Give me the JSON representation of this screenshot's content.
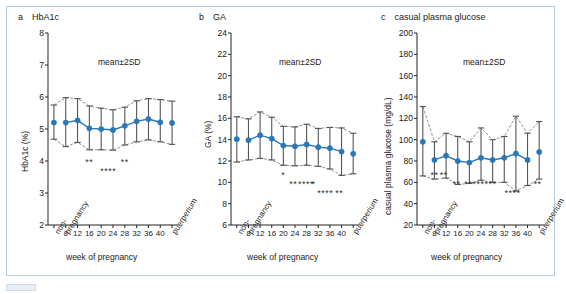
{
  "figure": {
    "background": "#ffffff",
    "frame_color": "#b9cfe0",
    "marker_color": "#2a77b8",
    "line_color": "#2a77b8",
    "errorbar_color": "#555555",
    "envelope_color": "#777777"
  },
  "common": {
    "xlabel": "week of pregnancy",
    "meansd": "mean±2SD",
    "x_categories": [
      "non-\npregnancy",
      "8",
      "12",
      "16",
      "20",
      "24",
      "28",
      "32",
      "36",
      "40",
      "puerperium"
    ],
    "x_left_label": "non-\npregnancy",
    "x_right_label": "puerperium",
    "x_numeric_ticks": [
      "8",
      "12",
      "16",
      "20",
      "24",
      "28",
      "32",
      "36",
      "40"
    ]
  },
  "chart_data": [
    {
      "panel": "a",
      "type": "line",
      "title": "a  HbA1c",
      "panel_letter": "a",
      "panel_name": "HbA1c",
      "ylabel": "HbA1c (%)",
      "xlabel": "week of pregnancy",
      "annotation": "mean±2SD",
      "ylim": [
        2,
        8
      ],
      "yticks": [
        2,
        3,
        4,
        5,
        6,
        7,
        8
      ],
      "grid": false,
      "legend": "none",
      "categories": [
        "non-pregnancy",
        "8",
        "12",
        "16",
        "20",
        "24",
        "28",
        "32",
        "36",
        "40",
        "puerperium"
      ],
      "values": [
        5.2,
        5.2,
        5.27,
        5.02,
        5.0,
        4.97,
        5.1,
        5.24,
        5.31,
        5.21,
        5.19
      ],
      "upper_2sd": [
        5.75,
        5.98,
        5.95,
        5.72,
        5.65,
        5.6,
        5.68,
        5.88,
        5.95,
        5.92,
        5.87
      ],
      "lower_2sd": [
        4.68,
        4.45,
        4.58,
        4.35,
        4.35,
        4.34,
        4.5,
        4.6,
        4.66,
        4.6,
        4.52
      ],
      "significance_rows": [
        {
          "marks": "**",
          "x_index": 3,
          "row": 0
        },
        {
          "marks": "**",
          "x_index": 6,
          "row": 0
        },
        {
          "marks": "****",
          "x_index": 4.6,
          "row": 1
        }
      ]
    },
    {
      "panel": "b",
      "type": "line",
      "title": "b  GA",
      "panel_letter": "b",
      "panel_name": "GA",
      "ylabel": "GA (%)",
      "xlabel": "week of pregnancy",
      "annotation": "mean±2SD",
      "ylim": [
        6,
        24
      ],
      "yticks": [
        6,
        8,
        10,
        12,
        14,
        16,
        18,
        20,
        22,
        24
      ],
      "grid": false,
      "legend": "none",
      "categories": [
        "non-pregnancy",
        "8",
        "12",
        "16",
        "20",
        "24",
        "28",
        "32",
        "36",
        "40",
        "puerperium"
      ],
      "values": [
        14.05,
        13.95,
        14.42,
        14.1,
        13.45,
        13.38,
        13.55,
        13.3,
        13.2,
        12.88,
        12.68
      ],
      "upper_2sd": [
        16.15,
        15.95,
        16.6,
        16.1,
        15.25,
        15.2,
        15.45,
        15.05,
        15.15,
        15.1,
        14.6
      ],
      "lower_2sd": [
        11.9,
        12.1,
        12.25,
        12.1,
        11.6,
        11.55,
        11.6,
        11.5,
        11.25,
        10.65,
        10.8
      ],
      "significance_rows": [
        {
          "marks": "*",
          "x_index": 4,
          "row": 0
        },
        {
          "marks": "**",
          "x_index": 4.85,
          "row": 1
        },
        {
          "marks": "****",
          "x_index": 5.95,
          "row": 1
        },
        {
          "marks": "*",
          "x_index": 6.6,
          "row": 1
        },
        {
          "marks": "****",
          "x_index": 7.6,
          "row": 2
        },
        {
          "marks": "**",
          "x_index": 8.8,
          "row": 2
        }
      ]
    },
    {
      "panel": "c",
      "type": "line",
      "title": "c  casual plasma glucose",
      "panel_letter": "c",
      "panel_name": "casual plasma glucose",
      "ylabel": "casual plasma glucose (mg/dL)",
      "xlabel": "week of pregnancy",
      "annotation": "mean±2SD",
      "ylim": [
        20,
        200
      ],
      "yticks": [
        20,
        40,
        60,
        80,
        100,
        120,
        140,
        160,
        180,
        200
      ],
      "grid": false,
      "legend": "none",
      "categories": [
        "non-pregnancy",
        "8",
        "12",
        "16",
        "20",
        "24",
        "28",
        "32",
        "36",
        "40",
        "puerperium"
      ],
      "values": [
        98,
        81,
        85,
        80,
        78.5,
        83,
        81,
        83,
        87,
        81,
        88.5
      ],
      "upper_2sd": [
        131,
        98,
        106,
        103,
        98,
        111,
        100,
        103,
        122,
        106,
        117
      ],
      "lower_2sd": [
        66,
        63,
        64,
        58,
        59,
        62,
        60,
        60,
        52,
        57,
        63
      ],
      "significance_rows": [
        {
          "marks": "**",
          "x_index": 1,
          "row": 0
        },
        {
          "marks": "**",
          "x_index": 1.8,
          "row": 0
        },
        {
          "marks": "**",
          "x_index": 2.9,
          "row": 1
        },
        {
          "marks": "**",
          "x_index": 3.9,
          "row": 1
        },
        {
          "marks": "******",
          "x_index": 5.3,
          "row": 1
        },
        {
          "marks": "****",
          "x_index": 7.7,
          "row": 2
        },
        {
          "marks": "**",
          "x_index": 9.85,
          "row": 1
        }
      ]
    }
  ]
}
